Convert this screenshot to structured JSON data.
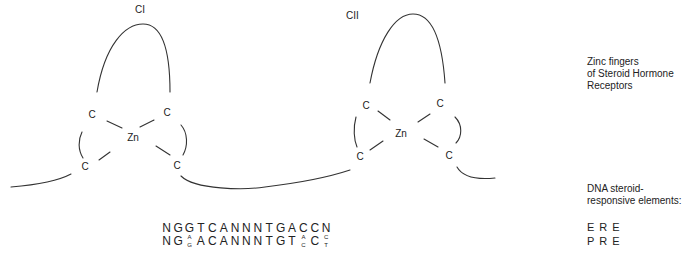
{
  "fingers": [
    {
      "label": "CI",
      "zinc": "Zn",
      "cysteines": [
        "C",
        "C",
        "C",
        "C"
      ]
    },
    {
      "label": "CII",
      "zinc": "Zn",
      "cysteines": [
        "C",
        "C",
        "C",
        "C"
      ]
    }
  ],
  "captions": {
    "zinc_fingers": "Zinc fingers\nof Steroid Hormone\nReceptors",
    "dna_elements": "DNA steroid-\nresponsive elements:"
  },
  "sequences": [
    {
      "tag": "ERE",
      "positions": [
        "N",
        "G",
        "G",
        "T",
        "C",
        "A",
        "N",
        "N",
        "N",
        "T",
        "G",
        "A",
        "C",
        "C",
        "N"
      ]
    },
    {
      "tag": "PRE",
      "positions": [
        "N",
        "G",
        [
          "A",
          "G"
        ],
        "A",
        "C",
        "A",
        "N",
        "N",
        "N",
        "T",
        "G",
        "T",
        [
          "A",
          "C"
        ],
        "C",
        [
          "C",
          "T"
        ]
      ]
    }
  ],
  "colors": {
    "line": "#333333",
    "text": "#222222",
    "background": "#ffffff"
  }
}
